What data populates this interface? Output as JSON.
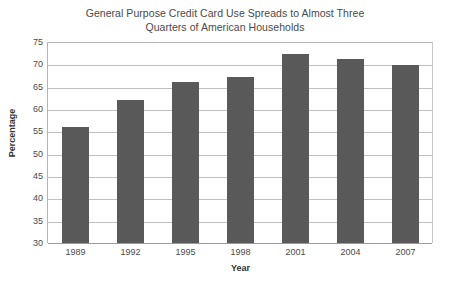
{
  "chart_data": {
    "type": "bar",
    "title": "General Purpose Credit Card Use Spreads to Almost Three Quarters of American Households",
    "title_lines": [
      "General Purpose Credit Card Use Spreads to Almost Three",
      "Quarters of American Households"
    ],
    "xlabel": "Year",
    "ylabel": "Percentage",
    "categories": [
      "1989",
      "1992",
      "1995",
      "1998",
      "2001",
      "2004",
      "2007"
    ],
    "values": [
      56.0,
      62.2,
      66.2,
      67.3,
      72.5,
      71.5,
      70.0
    ],
    "ylim": [
      30,
      75
    ],
    "ytick_step": 5,
    "ytick_labels": [
      "75",
      "70",
      "65",
      "60",
      "55",
      "50",
      "45",
      "40",
      "35",
      "30"
    ],
    "grid": true,
    "legend": "none",
    "bar_color": "#595959",
    "gridline_color": "#c0c0c0",
    "background_color": "#ffffff",
    "text_color": "#4a4a4a"
  }
}
